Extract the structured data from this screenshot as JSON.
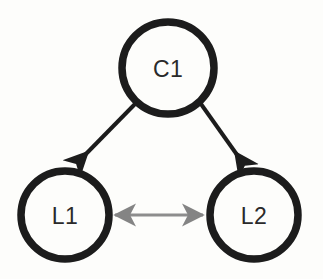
{
  "diagram": {
    "background_color": "#fdfdfb",
    "node_stroke_color": "#1c1c1c",
    "label_color": "#2a2a2a",
    "directed_edge_color": "#1c1c1c",
    "bidirectional_edge_color": "#808080",
    "nodes": [
      {
        "id": "c1",
        "label": "C1",
        "shape": "circle",
        "cx": 168,
        "cy": 68,
        "r": 46,
        "stroke_width": 7.5
      },
      {
        "id": "l1",
        "label": "L1",
        "shape": "circle",
        "cx": 65,
        "cy": 215,
        "r": 44,
        "stroke_width": 7.5
      },
      {
        "id": "l2",
        "label": "L2",
        "shape": "circle",
        "cx": 254,
        "cy": 215,
        "r": 44,
        "stroke_width": 7.5
      }
    ],
    "edges": [
      {
        "id": "c1-to-l1",
        "from": "c1",
        "to": "l1",
        "type": "directed",
        "direction": "one-way",
        "color": "#1c1c1c",
        "stroke_width": 4,
        "x1": 135,
        "y1": 104,
        "x2": 82,
        "y2": 158
      },
      {
        "id": "c1-to-l2",
        "from": "c1",
        "to": "l2",
        "type": "directed",
        "direction": "one-way",
        "color": "#1c1c1c",
        "stroke_width": 4,
        "x1": 201,
        "y1": 104,
        "x2": 240,
        "y2": 159
      },
      {
        "id": "l1-to-l2",
        "from": "l1",
        "to": "l2",
        "type": "bidirectional",
        "direction": "two-way",
        "color": "#808080",
        "stroke_width": 3,
        "x1": 115,
        "y1": 215,
        "x2": 203,
        "y2": 215
      }
    ]
  }
}
